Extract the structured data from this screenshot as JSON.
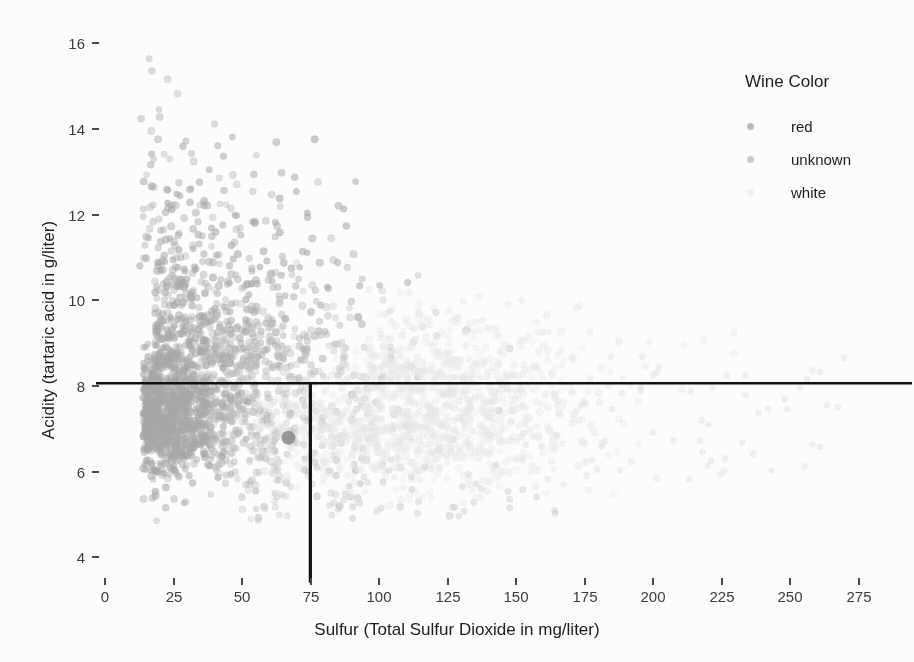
{
  "chart_data": {
    "type": "scatter",
    "title": "",
    "xlabel": "Sulfur (Total Sulfur Dioxide  in mg/liter)",
    "ylabel": "Acidity (tartaric acid in g/liter)",
    "xlim": [
      -8,
      288
    ],
    "ylim": [
      3.3,
      16.4
    ],
    "xticks": [
      0,
      25,
      50,
      75,
      100,
      125,
      150,
      175,
      200,
      225,
      250,
      275
    ],
    "yticks": [
      4,
      6,
      8,
      10,
      12,
      14,
      16
    ],
    "grid": false,
    "legend": {
      "title": "Wine Color",
      "position": "right",
      "entries": [
        {
          "label": "red",
          "color": "#b9b9b9"
        },
        {
          "label": "unknown",
          "color": "#c4c4c4"
        },
        {
          "label": "white",
          "color": "#ededed"
        }
      ]
    },
    "annotations": [
      {
        "name": "horizontal-threshold-line",
        "type": "hline",
        "y": 8.05,
        "color": "#111111",
        "width": 2.4
      },
      {
        "name": "vertical-threshold-line",
        "type": "vline",
        "x": 75,
        "y_from": 3.4,
        "y_to": 8.05,
        "color": "#111111",
        "width": 3.2
      },
      {
        "name": "highlighted-point",
        "type": "point",
        "x": 67,
        "y": 6.78,
        "radius": 7,
        "color": "#8f8f8f"
      }
    ],
    "series": [
      {
        "name": "red",
        "color": "#a8a8a8",
        "point_radius": 3.4,
        "opacity": 0.55,
        "count": 1599
      },
      {
        "name": "unknown",
        "color": "#bdbdbd",
        "point_radius": 3.4,
        "opacity": 0.5,
        "count": 420
      },
      {
        "name": "white",
        "color": "#e6e6e6",
        "point_radius": 3.4,
        "opacity": 0.45,
        "count": 1200
      }
    ]
  }
}
